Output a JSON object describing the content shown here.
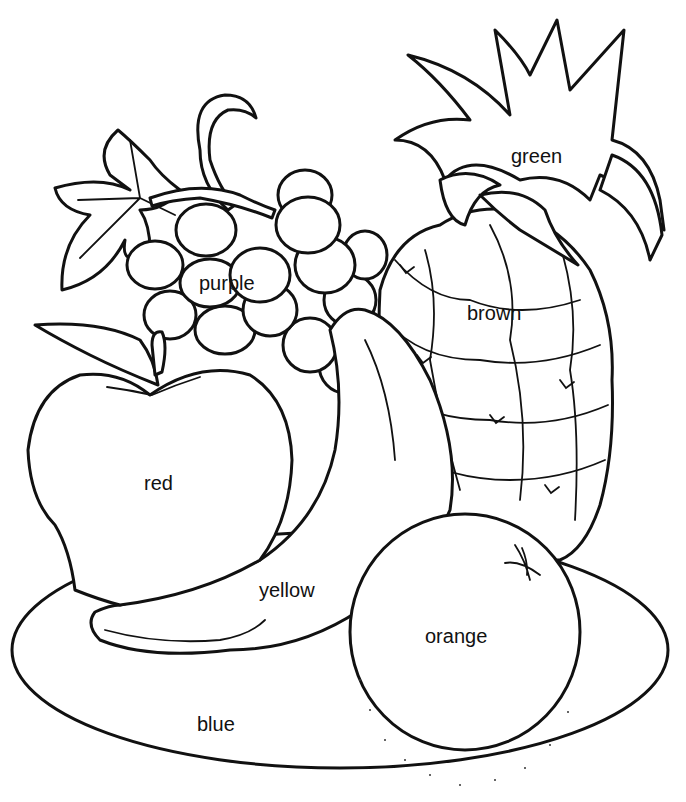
{
  "labels": {
    "green": "green",
    "purple": "purple",
    "brown": "brown",
    "red": "red",
    "yellow": "yellow",
    "orange": "orange",
    "blue": "blue"
  },
  "regions": [
    {
      "object": "pineapple leaves",
      "color_word": "green"
    },
    {
      "object": "grapes",
      "color_word": "purple"
    },
    {
      "object": "pineapple",
      "color_word": "brown"
    },
    {
      "object": "apple",
      "color_word": "red"
    },
    {
      "object": "banana",
      "color_word": "yellow"
    },
    {
      "object": "orange",
      "color_word": "orange"
    },
    {
      "object": "plate",
      "color_word": "blue"
    }
  ],
  "colors": {
    "line": "#111111",
    "background": "#ffffff"
  }
}
